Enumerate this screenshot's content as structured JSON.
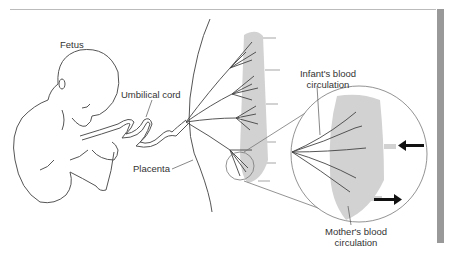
{
  "figure": {
    "type": "anatomical-diagram",
    "labels": {
      "fetus": "Fetus",
      "umbilical_cord": "Umbilical cord",
      "placenta": "Placenta",
      "infant_blood_line1": "Infant's blood",
      "infant_blood_line2": "circulation",
      "mother_blood_line1": "Mother's blood",
      "mother_blood_line2": "circulation"
    },
    "colors": {
      "line": "#444444",
      "maternal_tissue": "#cfcfcf",
      "arrow": "#111111",
      "side_bar": "#999999",
      "top_rule": "#bbbbbb"
    },
    "arrows": [
      {
        "direction": "left",
        "meaning": "maternal blood in"
      },
      {
        "direction": "right",
        "meaning": "maternal blood out"
      }
    ]
  }
}
